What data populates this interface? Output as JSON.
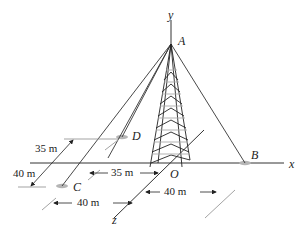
{
  "figure": {
    "axes": {
      "x": "x",
      "y": "y",
      "z": "z",
      "origin": "O"
    },
    "points": {
      "A": "A",
      "B": "B",
      "C": "C",
      "D": "D"
    },
    "dimensions": {
      "d_35_vertical": "35 m",
      "d_40_vertical": "40 m",
      "d_35_horizontal": "35 m",
      "d_40_left": "40 m",
      "d_40_right": "40 m"
    },
    "colors": {
      "line": "#222222",
      "anchor": "#b5b5b5",
      "tower_light": "#aaaaaa"
    }
  }
}
